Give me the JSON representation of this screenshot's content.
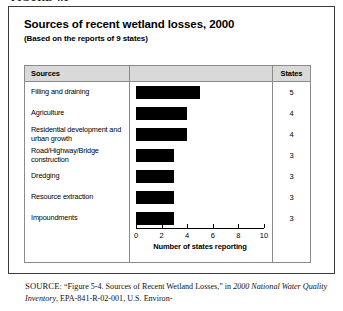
{
  "figure_caption": "FIGURE 4.1",
  "chart": {
    "title": "Sources of recent wetland losses, 2000",
    "subtitle": "(Based on the reports of 9 states)"
  },
  "table": {
    "headers": {
      "sources": "Sources",
      "states": "States"
    }
  },
  "chart_data": {
    "type": "bar",
    "orientation": "horizontal",
    "title": "Sources of recent wetland losses, 2000",
    "subtitle": "(Based on the reports of 9 states)",
    "xlabel": "Number of states reporting",
    "ylabel": "Sources",
    "xlim": [
      0,
      10
    ],
    "xticks": [
      0,
      2,
      4,
      6,
      8,
      10
    ],
    "xtick_labels": [
      "0",
      "2",
      "4",
      "6",
      "8",
      "10"
    ],
    "grid": false,
    "legend": "none",
    "bar_color": "#000000",
    "categories": [
      "Filling and draining",
      "Agriculture",
      "Residential development and urban growth",
      "Road/Highway/Bridge construction",
      "Dredging",
      "Resource extraction",
      "Impoundments"
    ],
    "values": [
      5,
      4,
      4,
      3,
      3,
      3,
      3
    ],
    "value_labels": [
      "5",
      "4",
      "4",
      "3",
      "3",
      "3",
      "3"
    ]
  },
  "source_note": {
    "label": "SOURCE:",
    "text_part1": " “Figure 5-4. Sources of Recent Wetland Losses,” in ",
    "italic1": "2000 National Water Quality Inventory",
    "text_part2": ", EPA-841-R-02-001, U.S. Environ-"
  }
}
